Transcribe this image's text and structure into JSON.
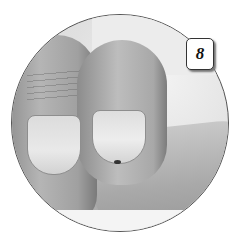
{
  "image": {
    "description": "Grayscale close-up photo of two fingertips with fingernails in a circular frame",
    "badge": {
      "number": "8"
    }
  }
}
